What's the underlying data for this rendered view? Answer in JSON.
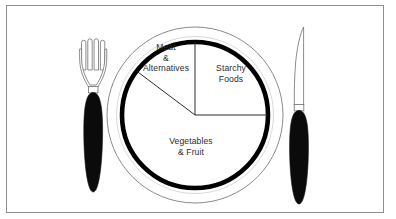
{
  "diagram": {
    "frame": {
      "border_color": "#8e8e8e"
    },
    "plate": {
      "outer_rim_color": "#7d7d7d",
      "inner_ring_color": "#000000",
      "fill_color": "#ffffff",
      "center_x": 195,
      "center_y": 115,
      "outer_radius": 88,
      "inner_radius": 73
    },
    "segments": [
      {
        "name": "meat-and-alternatives",
        "label_lines": [
          "Meat",
          "&",
          "Alternatives"
        ],
        "share_label": "1/4",
        "start_angle_deg": 90,
        "end_angle_deg": 143
      },
      {
        "name": "starchy-foods",
        "label_lines": [
          "Starchy",
          "Foods"
        ],
        "share_label": "1/4",
        "start_angle_deg": 0,
        "end_angle_deg": 90
      },
      {
        "name": "vegetables-and-fruit",
        "label_lines": [
          "Vegetables",
          "& Fruit"
        ],
        "share_label": "1/2",
        "start_angle_deg": 180,
        "end_angle_deg": 360
      }
    ],
    "utensils": [
      {
        "name": "fork",
        "side": "left",
        "tine_count": 4,
        "handle_color": "#0b0b0b",
        "outline_color": "#6f6f6f"
      },
      {
        "name": "knife",
        "side": "right",
        "handle_color": "#0b0b0b",
        "outline_color": "#6f6f6f"
      }
    ]
  },
  "labels": {
    "meat_line_1": "Meat",
    "meat_line_2": "&",
    "meat_line_3": "Alternatives",
    "starchy_line_1": "Starchy",
    "starchy_line_2": "Foods",
    "veg_line_1": "Vegetables",
    "veg_line_2": "& Fruit"
  }
}
